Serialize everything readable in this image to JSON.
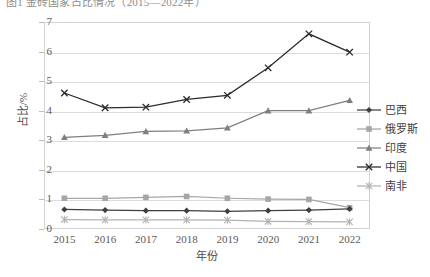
{
  "caption": {
    "text": "图1  金砖国家占比情况（2015—2022年）"
  },
  "chart_data": {
    "type": "line",
    "title": "",
    "xlabel": "年份",
    "ylabel": "占比/%",
    "categories": [
      "2015",
      "2016",
      "2017",
      "2018",
      "2019",
      "2020",
      "2021",
      "2022"
    ],
    "x": [
      2015,
      2016,
      2017,
      2018,
      2019,
      2020,
      2021,
      2022
    ],
    "ylim": [
      0,
      7
    ],
    "yticks": [
      "0",
      "1",
      "2",
      "3",
      "4",
      "5",
      "6",
      "7"
    ],
    "grid": true,
    "legend_position": "right",
    "series": [
      {
        "name": "巴西",
        "marker": "diamond",
        "color": "#3f3f3f",
        "values": [
          0.66,
          0.64,
          0.62,
          0.62,
          0.6,
          0.62,
          0.64,
          0.68
        ]
      },
      {
        "name": "俄罗斯",
        "marker": "square",
        "color": "#a6a6a6",
        "values": [
          1.04,
          1.04,
          1.07,
          1.1,
          1.04,
          1.01,
          1.0,
          0.72
        ]
      },
      {
        "name": "印度",
        "marker": "triangle",
        "color": "#7f7f7f",
        "values": [
          3.1,
          3.17,
          3.3,
          3.32,
          3.42,
          4.0,
          4.0,
          4.35
        ]
      },
      {
        "name": "中国",
        "marker": "cross",
        "color": "#2b2b2b",
        "values": [
          4.6,
          4.1,
          4.12,
          4.38,
          4.52,
          5.45,
          6.6,
          5.98
        ]
      },
      {
        "name": "南非",
        "marker": "asterisk",
        "color": "#b3b3b3",
        "values": [
          0.32,
          0.31,
          0.31,
          0.31,
          0.3,
          0.26,
          0.25,
          0.24
        ]
      }
    ]
  }
}
